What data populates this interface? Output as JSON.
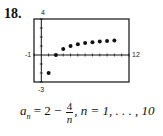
{
  "problem_number": "18.",
  "formula": {
    "lhs": "a",
    "lhs_sub": "n",
    "eq": " = 2 − ",
    "frac_num": "4",
    "frac_den": "n",
    "rest": ", n = 1, . . . , 10"
  },
  "axis_labels": {
    "ymax": "4",
    "ymin": "-3",
    "xmin": "-1",
    "xmax": "12"
  },
  "chart_data": {
    "type": "scatter",
    "title": "",
    "xlabel": "n",
    "ylabel": "a_n",
    "xlim": [
      -1,
      12
    ],
    "ylim": [
      -3,
      4
    ],
    "grid": false,
    "x": [
      1,
      2,
      3,
      4,
      5,
      6,
      7,
      8,
      9,
      10
    ],
    "values": [
      -2,
      0,
      0.667,
      1,
      1.2,
      1.333,
      1.429,
      1.5,
      1.556,
      1.6
    ],
    "annotations": [
      "a_n = 2 - 4/n, n = 1, ..., 10"
    ],
    "tick_labels": {
      "x": [
        "-1",
        "12"
      ],
      "y": [
        "-3",
        "4"
      ]
    }
  }
}
